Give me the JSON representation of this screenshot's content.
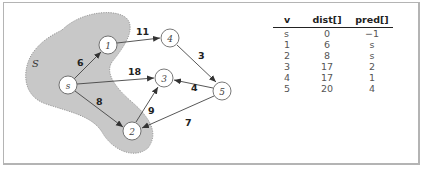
{
  "graph": {
    "set_label": "S",
    "nodes": [
      {
        "id": "s",
        "label": "s",
        "x": 68,
        "y": 85,
        "in_set": true
      },
      {
        "id": "1",
        "label": "1",
        "x": 108,
        "y": 45,
        "in_set": true
      },
      {
        "id": "2",
        "label": "2",
        "x": 132,
        "y": 131,
        "in_set": true
      },
      {
        "id": "3",
        "label": "3",
        "x": 164,
        "y": 78,
        "in_set": false
      },
      {
        "id": "4",
        "label": "4",
        "x": 170,
        "y": 38,
        "in_set": false
      },
      {
        "id": "5",
        "label": "5",
        "x": 222,
        "y": 91,
        "in_set": false
      }
    ],
    "edges": [
      {
        "from": "s",
        "to": "1",
        "weight": "6"
      },
      {
        "from": "s",
        "to": "3",
        "weight": "18"
      },
      {
        "from": "s",
        "to": "2",
        "weight": "8"
      },
      {
        "from": "1",
        "to": "4",
        "weight": "11"
      },
      {
        "from": "4",
        "to": "5",
        "weight": "3"
      },
      {
        "from": "5",
        "to": "3",
        "weight": "4"
      },
      {
        "from": "2",
        "to": "3",
        "weight": "9"
      },
      {
        "from": "5",
        "to": "2",
        "weight": "7"
      }
    ]
  },
  "table": {
    "headers": [
      "v",
      "dist[]",
      "pred[]"
    ],
    "rows": [
      [
        "s",
        "0",
        "−1"
      ],
      [
        "1",
        "6",
        "s"
      ],
      [
        "2",
        "8",
        "s"
      ],
      [
        "3",
        "17",
        "2"
      ],
      [
        "4",
        "17",
        "1"
      ],
      [
        "5",
        "20",
        "4"
      ]
    ]
  },
  "colors": {
    "set_fill": "#c8c8c8",
    "set_border": "#888888",
    "edge": "#444444",
    "frame": "#b4b4b4"
  }
}
